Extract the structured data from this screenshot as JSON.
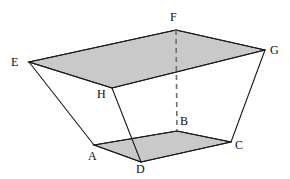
{
  "figure": {
    "name": "frustum-solid",
    "canvas": {
      "width": 290,
      "height": 179
    },
    "background_color": "#ffffff",
    "stroke_color": "#1a1a1a",
    "face_fill_color": "#c9c9c9",
    "hidden_edge_color": "#6e6e6e",
    "stroke_width": 1.1,
    "hidden_edge_width": 1.6,
    "hidden_edge_dash": "5,4"
  },
  "vertices": {
    "A": {
      "label": "A",
      "x": 94,
      "y": 145,
      "label_x": 88,
      "label_y": 150,
      "hidden": false
    },
    "B": {
      "label": "B",
      "x": 177,
      "y": 131,
      "label_x": 180,
      "label_y": 115,
      "hidden": true
    },
    "C": {
      "label": "C",
      "x": 231,
      "y": 142,
      "label_x": 235,
      "label_y": 139,
      "hidden": false
    },
    "D": {
      "label": "D",
      "x": 141,
      "y": 162,
      "label_x": 136,
      "label_y": 163,
      "hidden": false
    },
    "E": {
      "label": "E",
      "x": 29,
      "y": 62,
      "label_x": 11,
      "label_y": 56,
      "hidden": false
    },
    "F": {
      "label": "F",
      "x": 176,
      "y": 30,
      "label_x": 170,
      "label_y": 11,
      "hidden": false
    },
    "G": {
      "label": "G",
      "x": 265,
      "y": 50,
      "label_x": 270,
      "label_y": 44,
      "hidden": false
    },
    "H": {
      "label": "H",
      "x": 112,
      "y": 88,
      "label_x": 97,
      "label_y": 88,
      "hidden": false
    }
  },
  "faces": [
    {
      "name": "top-face-EFGH",
      "points": "29,62 176,30 265,50 112,88",
      "fill": "#c9c9c9"
    },
    {
      "name": "bottom-face-ABCD",
      "points": "94,145 177,131 231,142 141,162",
      "fill": "#c9c9c9"
    }
  ],
  "edges": [
    {
      "name": "edge-E-F",
      "x1": 29,
      "y1": 62,
      "x2": 176,
      "y2": 30,
      "hidden": false
    },
    {
      "name": "edge-F-G",
      "x1": 176,
      "y1": 30,
      "x2": 265,
      "y2": 50,
      "hidden": false
    },
    {
      "name": "edge-G-H",
      "x1": 265,
      "y1": 50,
      "x2": 112,
      "y2": 88,
      "hidden": false
    },
    {
      "name": "edge-H-E",
      "x1": 112,
      "y1": 88,
      "x2": 29,
      "y2": 62,
      "hidden": false
    },
    {
      "name": "edge-A-B",
      "x1": 94,
      "y1": 145,
      "x2": 177,
      "y2": 131,
      "hidden": false
    },
    {
      "name": "edge-B-C",
      "x1": 177,
      "y1": 131,
      "x2": 231,
      "y2": 142,
      "hidden": false
    },
    {
      "name": "edge-C-D",
      "x1": 231,
      "y1": 142,
      "x2": 141,
      "y2": 162,
      "hidden": false
    },
    {
      "name": "edge-D-A",
      "x1": 141,
      "y1": 162,
      "x2": 94,
      "y2": 145,
      "hidden": false
    },
    {
      "name": "edge-E-A",
      "x1": 29,
      "y1": 62,
      "x2": 94,
      "y2": 145,
      "hidden": false
    },
    {
      "name": "edge-H-D",
      "x1": 112,
      "y1": 88,
      "x2": 141,
      "y2": 162,
      "hidden": false
    },
    {
      "name": "edge-G-C",
      "x1": 265,
      "y1": 50,
      "x2": 231,
      "y2": 142,
      "hidden": false
    },
    {
      "name": "edge-F-B",
      "x1": 176,
      "y1": 30,
      "x2": 177,
      "y2": 131,
      "hidden": true
    }
  ]
}
